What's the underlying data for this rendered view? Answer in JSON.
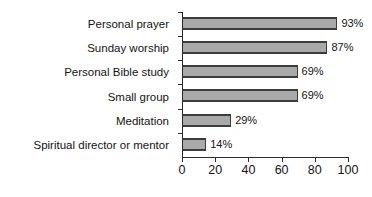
{
  "chart_data": {
    "type": "bar",
    "orientation": "horizontal",
    "title": "",
    "subtitle": "",
    "xlabel": "",
    "ylabel": "",
    "xlim": [
      0,
      100
    ],
    "xticks": [
      0,
      20,
      40,
      60,
      80,
      100
    ],
    "tick_labels": [
      "0",
      "20",
      "40",
      "60",
      "80",
      "100"
    ],
    "grid": false,
    "legend": false,
    "legend_position": "none",
    "categories": [
      "Personal prayer",
      "Sunday worship",
      "Personal Bible study",
      "Small group",
      "Meditation",
      "Spiritual director or mentor"
    ],
    "values": [
      93,
      87,
      69,
      69,
      29,
      14
    ],
    "value_labels": [
      "93%",
      "87%",
      "69%",
      "69%",
      "29%",
      "14%"
    ],
    "series": [
      {
        "name": "",
        "values": [
          93,
          87,
          69,
          69,
          29,
          14
        ]
      }
    ],
    "colors": {
      "bar_fill": "#a9a9a9",
      "bar_border": "#3c3c3c",
      "axis": "#2b2b2b",
      "text": "#131313",
      "background": "#ffffff"
    }
  }
}
